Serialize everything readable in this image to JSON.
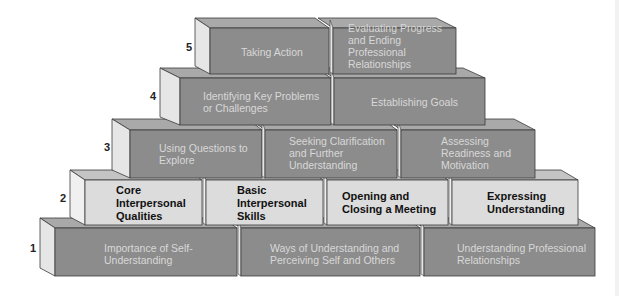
{
  "diagram": {
    "type": "pyramid-of-bricks",
    "colors": {
      "dark_front": "#8c8c8c",
      "dark_top": "#a9a9a9",
      "dark_side": "#e6e6e6",
      "light_front": "#dcdcdc",
      "light_top": "#c4c4c4",
      "light_side": "#f0f0f0",
      "outline": "#3a3a3a"
    },
    "rows": [
      {
        "level": "5",
        "bricks": [
          {
            "label": "Taking Action"
          },
          {
            "label": "Evaluating Progress and Ending Professional Relationships"
          }
        ]
      },
      {
        "level": "4",
        "bricks": [
          {
            "label": "Identifying Key Problems or Challenges"
          },
          {
            "label": "Establishing Goals"
          }
        ]
      },
      {
        "level": "3",
        "bricks": [
          {
            "label": "Using Questions to Explore"
          },
          {
            "label": "Seeking Clarification and Further Understanding"
          },
          {
            "label": "Assessing Readiness and Motivation"
          }
        ]
      },
      {
        "level": "2",
        "bricks": [
          {
            "label": "Core Interpersonal Qualities"
          },
          {
            "label": "Basic Interpersonal Skills"
          },
          {
            "label": "Opening and Closing a Meeting"
          },
          {
            "label": "Expressing Understanding"
          }
        ]
      },
      {
        "level": "1",
        "bricks": [
          {
            "label": "Importance of Self-Understanding"
          },
          {
            "label": "Ways of Understanding and Perceiving Self and Others"
          },
          {
            "label": "Understanding Professional Relationships"
          }
        ]
      }
    ]
  }
}
